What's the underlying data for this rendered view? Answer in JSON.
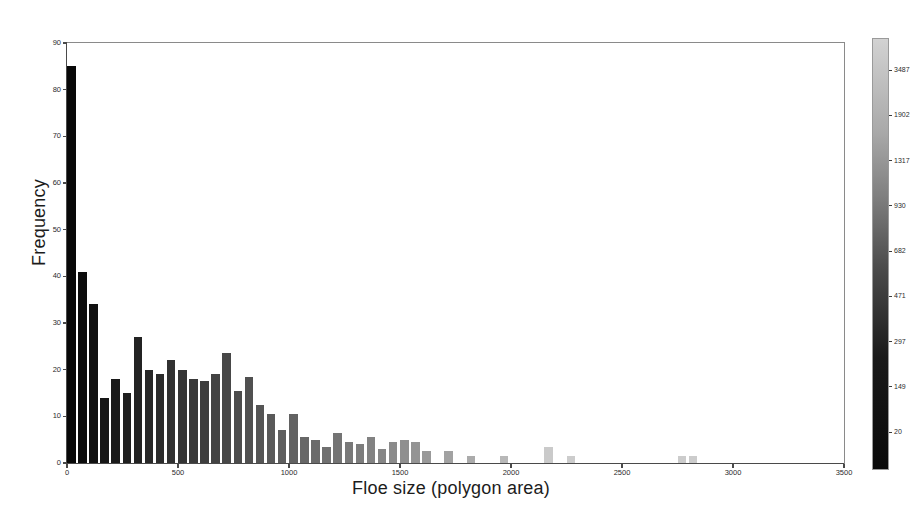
{
  "chart_data": {
    "type": "bar",
    "title": "",
    "xlabel": "Floe size (polygon area)",
    "ylabel": "Frequency",
    "xlim": [
      0,
      3500
    ],
    "ylim": [
      0,
      90
    ],
    "grid": false,
    "legend": "none",
    "xticks": [
      0,
      500,
      1000,
      1500,
      2000,
      2500,
      3000,
      3500
    ],
    "xtick_labels": [
      "0",
      "500",
      "1000",
      "1500",
      "2000",
      "2500",
      "3000",
      "3500"
    ],
    "yticks": [
      0,
      10,
      20,
      30,
      40,
      50,
      60,
      70,
      80,
      90
    ],
    "ytick_labels": [
      "0",
      "10",
      "20",
      "30",
      "40",
      "50",
      "60",
      "70",
      "80",
      "90"
    ],
    "bin_width": 50,
    "x": [
      25,
      75,
      125,
      175,
      225,
      275,
      325,
      375,
      425,
      475,
      525,
      575,
      625,
      675,
      725,
      775,
      825,
      875,
      925,
      975,
      1025,
      1075,
      1125,
      1175,
      1225,
      1275,
      1325,
      1375,
      1425,
      1475,
      1525,
      1575,
      1625,
      1675,
      1725,
      1775,
      1825,
      1875,
      1925,
      1975,
      2025,
      2075,
      2125,
      2175,
      2225,
      2275,
      2325,
      2375,
      2425,
      2475,
      2525,
      2575,
      2625,
      2675,
      2725,
      2775,
      2825,
      2875,
      2925,
      2975,
      3025,
      3075,
      3125,
      3175,
      3225,
      3275,
      3325,
      3375,
      3425,
      3475
    ],
    "values": [
      85,
      41,
      34,
      14,
      18,
      15,
      27,
      20,
      19,
      22,
      20,
      18,
      17.5,
      19,
      23.5,
      15.5,
      18.5,
      12.5,
      10.5,
      7,
      10.5,
      5.5,
      5,
      3.5,
      6.5,
      4.5,
      4,
      5.5,
      3,
      4.5,
      5,
      4.5,
      2.5,
      0,
      2.5,
      0,
      1.5,
      0,
      0,
      1.5,
      0,
      0,
      0,
      3.5,
      0,
      1.5,
      0,
      0,
      0,
      0,
      0,
      0,
      0,
      0,
      0,
      1.5,
      1.5,
      0,
      0,
      0,
      0,
      0,
      0,
      0,
      0,
      0,
      0,
      0,
      0,
      0
    ],
    "colormap": "gray-reversed (dark = small floe, light = large floe)",
    "colorbar": {
      "label": "",
      "ticks": [
        20,
        149,
        297,
        471,
        682,
        930,
        1317,
        1902,
        3487
      ],
      "tick_labels": [
        "20",
        "149",
        "297",
        "471",
        "682",
        "930",
        "1317",
        "1902",
        "3487"
      ],
      "orientation": "vertical",
      "low_color": "#0a0a0a",
      "high_color": "#d2d2d2"
    }
  },
  "figure": {
    "background": "#ffffff",
    "axis_color": "#4a4a4a",
    "text_color": "#1c1c1c"
  }
}
